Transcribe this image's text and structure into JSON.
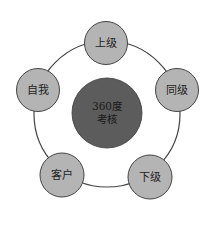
{
  "diagram": {
    "center": {
      "line1": "360度",
      "line2": "考核",
      "color": "#5c5c5c"
    },
    "ring_color": "#444444",
    "node_color": "#b4b4b4",
    "nodes": [
      {
        "id": "superior",
        "label": "上级"
      },
      {
        "id": "peer",
        "label": "同级"
      },
      {
        "id": "subordinate",
        "label": "下级"
      },
      {
        "id": "customer",
        "label": "客户"
      },
      {
        "id": "self",
        "label": "自我"
      }
    ]
  }
}
